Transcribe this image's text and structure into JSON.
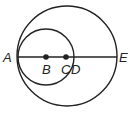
{
  "diagram": {
    "type": "geometry",
    "colors": {
      "stroke": "#222222",
      "background": "#ffffff"
    },
    "points": {
      "A": {
        "label": "A",
        "x": 18,
        "y": 57
      },
      "B": {
        "label": "B",
        "x": 46,
        "y": 57
      },
      "C": {
        "label": "C",
        "x": 66,
        "y": 57
      },
      "D": {
        "label": "D",
        "x": 74,
        "y": 57
      },
      "E": {
        "label": "E",
        "x": 117,
        "y": 57
      }
    },
    "circles": [
      {
        "name": "large-circle",
        "center": "C",
        "cx": 67,
        "cy": 56,
        "r": 50
      },
      {
        "name": "small-circle",
        "center": "B",
        "cx": 46,
        "cy": 57,
        "r": 28
      }
    ],
    "segments": [
      {
        "name": "diameter-AE",
        "from": "A",
        "to": "E"
      }
    ],
    "marked_points": [
      "B",
      "C"
    ]
  }
}
